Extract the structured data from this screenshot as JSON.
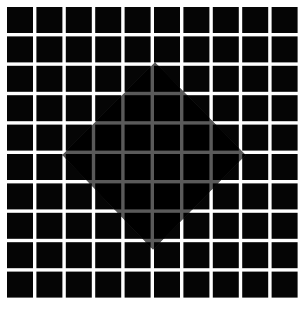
{
  "figure": {
    "grid": {
      "rows": 10,
      "cols": 10,
      "origin_x": 7,
      "origin_y": 7,
      "cell_size": 26,
      "pitch": 29.4
    },
    "diamond": {
      "top": [
        155,
        62
      ],
      "right": [
        246,
        155
      ],
      "bottom": [
        153,
        250
      ],
      "left": [
        62,
        155
      ]
    },
    "colors": {
      "background": "#ffffff",
      "square": "#050505",
      "diamond_fill": "#000000",
      "diamond_lines": "#5a5a5a"
    }
  }
}
